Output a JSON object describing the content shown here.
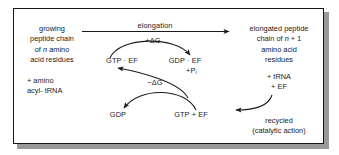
{
  "figure": {
    "border_color": "#151515",
    "background": "#ffffff",
    "ink_color": "#1a1a1a"
  },
  "left_block": {
    "lines": [
      "growing",
      "peptide chain",
      "of n amino",
      "acid residues"
    ],
    "line3_prefix": "of ",
    "line3_italic": "n",
    "line3_suffix": " amino"
  },
  "left_reactants": {
    "lines": [
      "+ amino",
      "acyl- tRNA"
    ]
  },
  "right_block": {
    "lines": [
      "elongated peptide",
      "chain of n + 1",
      "amino acid",
      "residues"
    ],
    "line2_prefix": "chain of ",
    "line2_italic": "n",
    "line2_suffix": " + 1"
  },
  "right_products": {
    "lines": [
      "+ tRNA",
      "+ EF"
    ]
  },
  "recycled_note": {
    "lines": [
      "recycled",
      "(catalytic action)"
    ]
  },
  "cycle": {
    "elongation_label": "elongation",
    "plus_dg": "+ΔG",
    "minus_dg": "−ΔG",
    "gtp_ef": "GTP · EF",
    "gdp_ef": "GDP · EF",
    "phosphate_prefix": "+P",
    "phosphate_sub": "i",
    "gdp": "GDP",
    "gtp_plus_ef": "GTP + EF"
  }
}
